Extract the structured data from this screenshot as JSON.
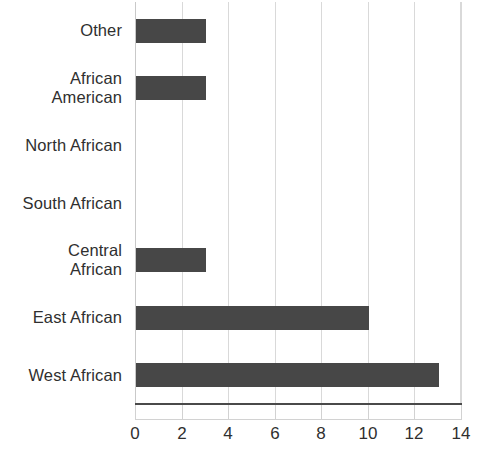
{
  "chart_data": {
    "type": "bar",
    "orientation": "horizontal",
    "title": "",
    "subtitle": "",
    "xlabel": "",
    "ylabel": "",
    "categories": [
      "Other",
      "African American",
      "North African",
      "South African",
      "Central African",
      "East African",
      "West African"
    ],
    "category_label_lines": [
      [
        "Other"
      ],
      [
        "African",
        "American"
      ],
      [
        "North African"
      ],
      [
        "South African"
      ],
      [
        "Central",
        "African"
      ],
      [
        "East African"
      ],
      [
        "West African"
      ]
    ],
    "values": [
      3,
      3,
      0,
      0,
      3,
      10,
      13
    ],
    "xlim": [
      0,
      14
    ],
    "xticks": [
      0,
      2,
      4,
      6,
      8,
      10,
      12,
      14
    ],
    "xtick_labels": [
      "0",
      "2",
      "4",
      "6",
      "8",
      "10",
      "12",
      "14"
    ],
    "grid": true,
    "grid_axis": "x",
    "legend": false,
    "legend_position": "none",
    "bar_color": "#474747",
    "grid_color": "#d9d9d9",
    "axis_color": "#4a4a4a",
    "text_color": "#2f2f2f",
    "background_color": "#ffffff"
  }
}
